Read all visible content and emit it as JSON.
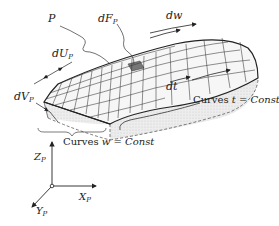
{
  "labels": {
    "P": "P",
    "dF": "dF",
    "dF_sub": "P",
    "dw": "dw",
    "dU": "dU",
    "dU_sub": "P",
    "dV": "dV",
    "dV_sub": "P",
    "dt": "dt",
    "curves_t_prefix": "Curves ",
    "curves_t_var": "t",
    "curves_t_eq": " = ",
    "curves_t_const": "Const",
    "curves_w_prefix": "Curves ",
    "curves_w_var": "w",
    "curves_w_eq": " = ",
    "curves_w_const": "Const"
  },
  "axes": {
    "z": "Z",
    "x": "X",
    "y": "Y",
    "sub": "P"
  },
  "colors": {
    "line": "#222222",
    "surface_fill": "#f2f2f2",
    "side_fill": "#e4e4e4",
    "highlight_cell": "#777777"
  }
}
